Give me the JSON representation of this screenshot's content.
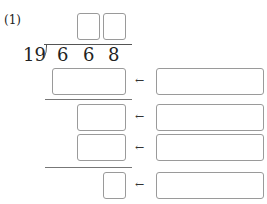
{
  "problem": {
    "number_label": "(1)",
    "divisor": "19",
    "dividend_digits": [
      "6",
      "6",
      "8"
    ],
    "arrow_glyph": "←"
  },
  "quotient_boxes": [
    {
      "value": ""
    },
    {
      "value": ""
    }
  ],
  "rows": [
    {
      "left_value": "",
      "right_value": ""
    },
    {
      "left_value": "",
      "right_value": ""
    },
    {
      "left_value": "",
      "right_value": ""
    },
    {
      "left_value": "",
      "right_value": ""
    }
  ]
}
